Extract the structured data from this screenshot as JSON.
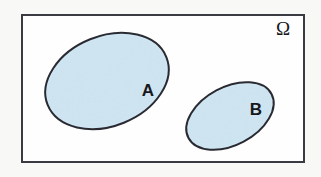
{
  "figure": {
    "type": "venn-diagram",
    "width": 321,
    "height": 177,
    "outer_background_color": "#f8f8f6"
  },
  "universe": {
    "label": "Ω",
    "label_name": "omega",
    "label_x": 283,
    "label_y": 31,
    "rect": {
      "x": 22,
      "y": 15,
      "width": 282,
      "height": 147
    },
    "fill_color": "#fefefe",
    "stroke_color": "#3a3a42",
    "stroke_width": 2
  },
  "sets": [
    {
      "id": "A",
      "label": "A",
      "cx": 107,
      "cy": 81,
      "rx": 64,
      "ry": 45,
      "rotation": -22,
      "fill_color": "#cfe6f3",
      "stroke_color": "#2b2b33",
      "stroke_width": 2,
      "label_x": 148,
      "label_y": 92
    },
    {
      "id": "B",
      "label": "B",
      "cx": 230,
      "cy": 116,
      "rx": 47,
      "ry": 29,
      "rotation": -28,
      "fill_color": "#cfe6f3",
      "stroke_color": "#2b2b33",
      "stroke_width": 2,
      "label_x": 256,
      "label_y": 111
    }
  ],
  "chart_data": {
    "type": "diagram",
    "title": "",
    "elements": [
      {
        "name": "Omega",
        "shape": "rectangle",
        "role": "sample space"
      },
      {
        "name": "A",
        "shape": "ellipse",
        "role": "event set"
      },
      {
        "name": "B",
        "shape": "ellipse",
        "role": "event set"
      }
    ],
    "relations": [
      {
        "between": [
          "A",
          "B"
        ],
        "type": "disjoint"
      },
      {
        "between": [
          "A",
          "Omega"
        ],
        "type": "subset"
      },
      {
        "between": [
          "B",
          "Omega"
        ],
        "type": "subset"
      }
    ]
  }
}
